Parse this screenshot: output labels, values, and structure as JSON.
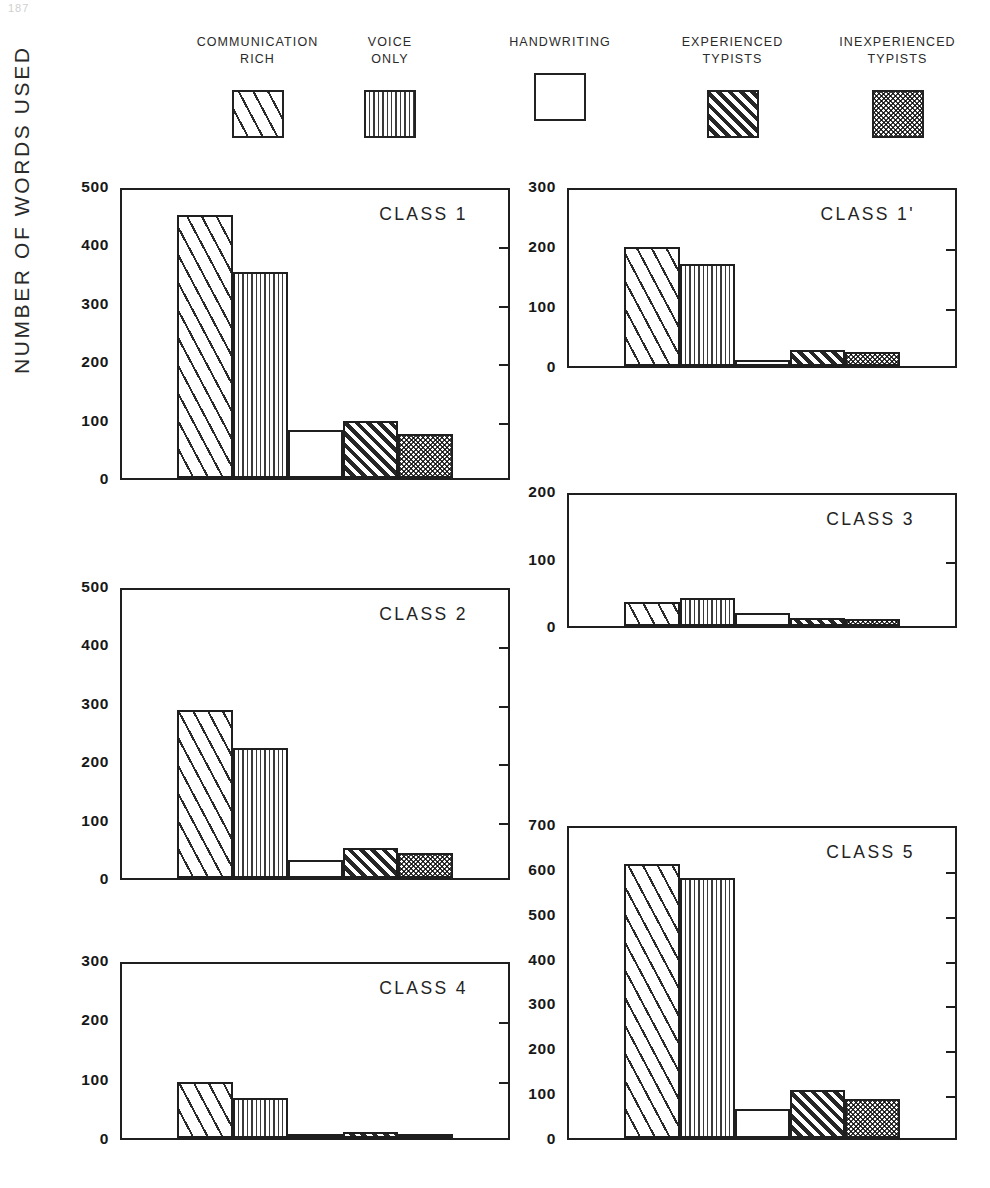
{
  "page_number": "187",
  "axis": {
    "y_title": "NUMBER OF WORDS USED"
  },
  "legend": {
    "items": [
      {
        "label": "COMMUNICATION\nRICH",
        "pattern": "diagonal-wide-hatch",
        "icon": "legend-swatch-icon"
      },
      {
        "label": "VOICE\nONLY",
        "pattern": "vertical-lines",
        "icon": "legend-swatch-icon"
      },
      {
        "label": "HANDWRITING",
        "pattern": "blank",
        "icon": "legend-swatch-icon"
      },
      {
        "label": "EXPERIENCED\nTYPISTS",
        "pattern": "diagonal-dense-hatch",
        "icon": "legend-swatch-icon"
      },
      {
        "label": "INEXPERIENCED\nTYPISTS",
        "pattern": "cross-hatch",
        "icon": "legend-swatch-icon"
      }
    ]
  },
  "chart_data": [
    {
      "type": "bar",
      "title": "CLASS 1",
      "xlabel": "",
      "ylabel": "NUMBER OF WORDS USED",
      "ylim": [
        0,
        500
      ],
      "yticks": [
        0,
        100,
        200,
        300,
        400,
        500
      ],
      "grid": false,
      "legend_position": "top",
      "categories": [
        "COMMUNICATION RICH",
        "VOICE ONLY",
        "HANDWRITING",
        "EXPERIENCED TYPISTS",
        "INEXPERIENCED TYPISTS"
      ],
      "values": [
        450,
        353,
        82,
        97,
        76
      ]
    },
    {
      "type": "bar",
      "title": "CLASS 1'",
      "xlabel": "",
      "ylabel": "NUMBER OF WORDS USED",
      "ylim": [
        0,
        300
      ],
      "yticks": [
        0,
        100,
        200,
        300
      ],
      "grid": false,
      "legend_position": "top",
      "categories": [
        "COMMUNICATION RICH",
        "VOICE ONLY",
        "HANDWRITING",
        "EXPERIENCED TYPISTS",
        "INEXPERIENCED TYPISTS"
      ],
      "values": [
        198,
        170,
        10,
        26,
        24
      ]
    },
    {
      "type": "bar",
      "title": "CLASS 2",
      "xlabel": "",
      "ylabel": "NUMBER OF WORDS USED",
      "ylim": [
        0,
        500
      ],
      "yticks": [
        0,
        100,
        200,
        300,
        400,
        500
      ],
      "grid": false,
      "legend_position": "top",
      "categories": [
        "COMMUNICATION RICH",
        "VOICE ONLY",
        "HANDWRITING",
        "EXPERIENCED TYPISTS",
        "INEXPERIENCED TYPISTS"
      ],
      "values": [
        288,
        222,
        30,
        52,
        43
      ]
    },
    {
      "type": "bar",
      "title": "CLASS 3",
      "xlabel": "",
      "ylabel": "NUMBER OF WORDS USED",
      "ylim": [
        0,
        200
      ],
      "yticks": [
        0,
        100,
        200
      ],
      "grid": false,
      "legend_position": "top",
      "categories": [
        "COMMUNICATION RICH",
        "VOICE ONLY",
        "HANDWRITING",
        "EXPERIENCED TYPISTS",
        "INEXPERIENCED TYPISTS"
      ],
      "values": [
        35,
        42,
        20,
        12,
        10
      ]
    },
    {
      "type": "bar",
      "title": "CLASS 4",
      "xlabel": "",
      "ylabel": "NUMBER OF WORDS USED",
      "ylim": [
        0,
        300
      ],
      "yticks": [
        0,
        100,
        200,
        300
      ],
      "grid": false,
      "legend_position": "top",
      "categories": [
        "COMMUNICATION RICH",
        "VOICE ONLY",
        "HANDWRITING",
        "EXPERIENCED TYPISTS",
        "INEXPERIENCED TYPISTS"
      ],
      "values": [
        95,
        67,
        4,
        10,
        6
      ]
    },
    {
      "type": "bar",
      "title": "CLASS 5",
      "xlabel": "",
      "ylabel": "NUMBER OF WORDS USED",
      "ylim": [
        0,
        700
      ],
      "yticks": [
        0,
        100,
        200,
        300,
        400,
        500,
        600,
        700
      ],
      "grid": false,
      "legend_position": "top",
      "categories": [
        "COMMUNICATION RICH",
        "VOICE ONLY",
        "HANDWRITING",
        "EXPERIENCED TYPISTS",
        "INEXPERIENCED TYPISTS"
      ],
      "values": [
        610,
        580,
        65,
        108,
        87
      ]
    }
  ],
  "layout": {
    "panels": [
      {
        "chart_index": 0,
        "left": 65,
        "top": 188,
        "width": 445,
        "height": 292
      },
      {
        "chart_index": 1,
        "left": 512,
        "top": 188,
        "width": 445,
        "height": 180
      },
      {
        "chart_index": 3,
        "left": 512,
        "top": 493,
        "width": 445,
        "height": 135
      },
      {
        "chart_index": 2,
        "left": 65,
        "top": 588,
        "width": 445,
        "height": 292
      },
      {
        "chart_index": 5,
        "left": 512,
        "top": 826,
        "width": 445,
        "height": 314
      },
      {
        "chart_index": 4,
        "left": 65,
        "top": 962,
        "width": 445,
        "height": 178
      }
    ],
    "bar_band": {
      "start_frac": 0.142,
      "bar_frac": 0.1415
    }
  }
}
